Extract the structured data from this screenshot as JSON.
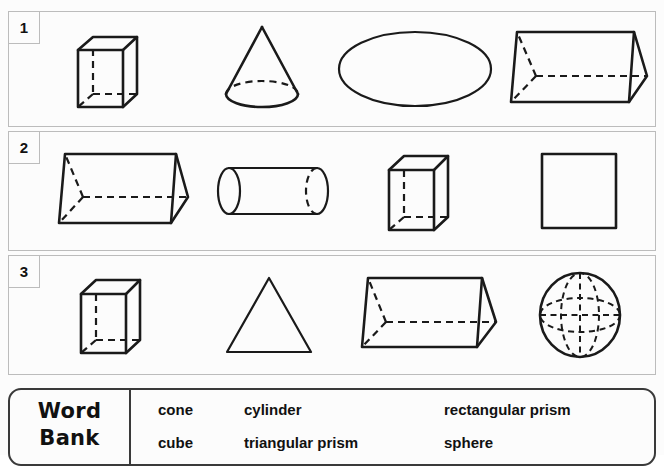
{
  "worksheet": {
    "type": "geometry-shape-identification-worksheet",
    "rows": [
      {
        "number": "1",
        "shapes": [
          {
            "name": "cube",
            "icon": "cube-icon",
            "dimension": "3D"
          },
          {
            "name": "cone",
            "icon": "cone-icon",
            "dimension": "3D"
          },
          {
            "name": "oval",
            "icon": "ellipse-icon",
            "dimension": "2D"
          },
          {
            "name": "triangular prism",
            "icon": "triangular-prism-icon",
            "dimension": "3D"
          }
        ]
      },
      {
        "number": "2",
        "shapes": [
          {
            "name": "triangular prism",
            "icon": "triangular-prism-icon",
            "dimension": "3D"
          },
          {
            "name": "cylinder",
            "icon": "cylinder-icon",
            "dimension": "3D"
          },
          {
            "name": "cube",
            "icon": "cube-icon",
            "dimension": "3D"
          },
          {
            "name": "square",
            "icon": "square-icon",
            "dimension": "2D"
          }
        ]
      },
      {
        "number": "3",
        "shapes": [
          {
            "name": "cube",
            "icon": "cube-icon",
            "dimension": "3D"
          },
          {
            "name": "triangle",
            "icon": "triangle-icon",
            "dimension": "2D"
          },
          {
            "name": "triangular prism",
            "icon": "triangular-prism-icon",
            "dimension": "3D"
          },
          {
            "name": "sphere",
            "icon": "sphere-icon",
            "dimension": "3D"
          }
        ]
      }
    ]
  },
  "word_bank": {
    "label_line1": "Word",
    "label_line2": "Bank",
    "terms": [
      [
        "cone",
        "cylinder",
        "rectangular prism"
      ],
      [
        "cube",
        "triangular prism",
        "sphere"
      ]
    ]
  },
  "colors": {
    "ink": "#1a1a1a",
    "panel_border": "#bcbcbc",
    "word_bank_border": "#3a3a3a",
    "background": "#fcfcfc"
  }
}
